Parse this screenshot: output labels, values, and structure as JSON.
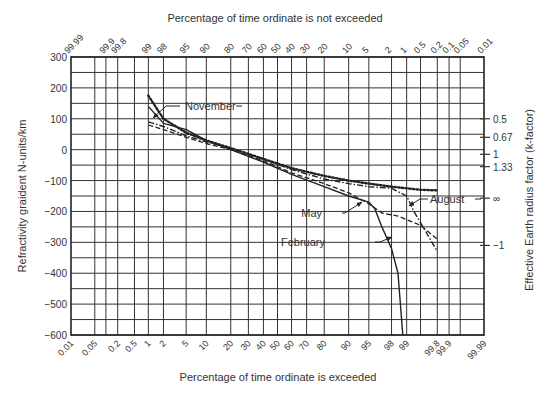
{
  "page_number": "119",
  "chart_data": {
    "type": "line",
    "title": "",
    "xlabel": "Percentage of time ordinate is exceeded",
    "xlabel_top": "Percentage of time ordinate is not exceeded",
    "ylabel": "Refractivity graident N-units/km",
    "ylabel_right": "Effective Earth radius factor (k-factor)",
    "ylim": [
      -600,
      300
    ],
    "y_ticks": [
      300,
      200,
      100,
      0,
      -100,
      -200,
      -300,
      -400,
      -500,
      -600
    ],
    "x_scale": "normal-probability",
    "x_ticks_bottom": [
      "0.01",
      "0.05",
      "0.2",
      "0.5",
      "1",
      "2",
      "5",
      "10",
      "20",
      "30",
      "40",
      "50",
      "60",
      "70",
      "80",
      "90",
      "95",
      "98",
      "99",
      "99.8",
      "99.9",
      "99.99"
    ],
    "x_ticks_top": [
      "99.99",
      "99.9",
      "99.8",
      "99",
      "98",
      "95",
      "90",
      "80",
      "70",
      "60",
      "50",
      "40",
      "30",
      "20",
      "10",
      "5",
      "2",
      "1",
      "0.5",
      "0.2",
      "0.1",
      "0.05",
      "0.01"
    ],
    "right_axis_ticks": [
      {
        "label": "0.5",
        "y": 100
      },
      {
        "label": "0.67",
        "y": 40
      },
      {
        "label": "1",
        "y": -15
      },
      {
        "label": "1.33",
        "y": -55
      },
      {
        "label": "∞",
        "y": -157
      },
      {
        "label": "−1",
        "y": -310
      }
    ],
    "grid": true,
    "legend": "inline-annotations",
    "series": [
      {
        "name": "November",
        "style": "dotted",
        "points": [
          [
            1,
            175
          ],
          [
            2,
            100
          ],
          [
            5,
            55
          ],
          [
            10,
            30
          ],
          [
            20,
            5
          ],
          [
            40,
            -30
          ],
          [
            60,
            -60
          ],
          [
            80,
            -85
          ],
          [
            90,
            -100
          ],
          [
            95,
            -110
          ],
          [
            98,
            -120
          ],
          [
            99.5,
            -130
          ],
          [
            99.8,
            -132
          ]
        ]
      },
      {
        "name": "February",
        "style": "solid",
        "points": [
          [
            1,
            140
          ],
          [
            2,
            85
          ],
          [
            5,
            65
          ],
          [
            10,
            30
          ],
          [
            20,
            0
          ],
          [
            40,
            -40
          ],
          [
            60,
            -80
          ],
          [
            80,
            -120
          ],
          [
            90,
            -150
          ],
          [
            95,
            -170
          ],
          [
            96,
            -190
          ],
          [
            97,
            -250
          ],
          [
            98,
            -320
          ],
          [
            98.5,
            -400
          ],
          [
            98.8,
            -600
          ]
        ]
      },
      {
        "name": "May",
        "style": "dashed",
        "points": [
          [
            1,
            80
          ],
          [
            2,
            65
          ],
          [
            5,
            40
          ],
          [
            10,
            20
          ],
          [
            20,
            0
          ],
          [
            40,
            -35
          ],
          [
            60,
            -75
          ],
          [
            80,
            -110
          ],
          [
            90,
            -140
          ],
          [
            95,
            -175
          ],
          [
            97,
            -205
          ],
          [
            98.5,
            -215
          ],
          [
            99.5,
            -245
          ],
          [
            99.8,
            -290
          ]
        ]
      },
      {
        "name": "August",
        "style": "dash-dot",
        "points": [
          [
            1,
            90
          ],
          [
            2,
            75
          ],
          [
            5,
            45
          ],
          [
            10,
            25
          ],
          [
            20,
            5
          ],
          [
            40,
            -30
          ],
          [
            60,
            -65
          ],
          [
            80,
            -95
          ],
          [
            90,
            -110
          ],
          [
            95,
            -120
          ],
          [
            98,
            -125
          ],
          [
            99,
            -150
          ],
          [
            99.3,
            -200
          ],
          [
            99.6,
            -260
          ],
          [
            99.8,
            -330
          ]
        ]
      }
    ],
    "annotations": [
      {
        "text": "November",
        "target_series": "November"
      },
      {
        "text": "May",
        "target_series": "May"
      },
      {
        "text": "August",
        "target_series": "August"
      },
      {
        "text": "February",
        "target_series": "February"
      }
    ]
  }
}
